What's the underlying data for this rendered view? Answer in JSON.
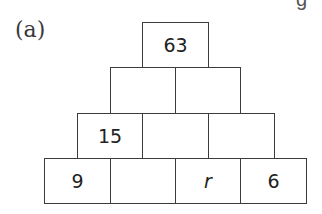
{
  "label": "(a)",
  "corner_glyph": "g",
  "pyramid": {
    "row1": [
      "63"
    ],
    "row2": [
      "",
      ""
    ],
    "row3": [
      "15",
      "",
      ""
    ],
    "row4": [
      "9",
      "",
      "r",
      "6"
    ]
  }
}
